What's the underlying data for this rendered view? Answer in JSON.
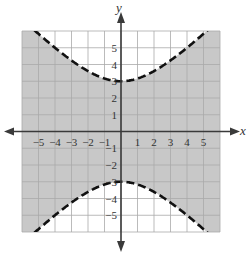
{
  "chart_data": {
    "type": "inequality-graph",
    "title": "",
    "relation": "y^2/9 - x^2/9 < 1",
    "boundary": {
      "curve": "hyperbola",
      "equation": "y^2/9 - x^2/9 = 1",
      "orientation": "vertical",
      "vertices": [
        [
          0,
          3
        ],
        [
          0,
          -3
        ]
      ],
      "style": "dashed"
    },
    "shaded_region": "between branches (contains origin)",
    "xlabel": "x",
    "ylabel": "y",
    "xlim": [
      -6,
      6
    ],
    "ylim": [
      -6,
      6
    ],
    "grid": true,
    "x_ticks": [
      "−5",
      "−4",
      "−3",
      "−2",
      "−1",
      "1",
      "2",
      "3",
      "4",
      "5"
    ],
    "y_ticks": [
      "5",
      "4",
      "3",
      "2",
      "1",
      "−1",
      "−2",
      "−3",
      "−4",
      "−5"
    ],
    "colors": {
      "shade": "#c8c8c8",
      "grid": "#a9a9a9",
      "axis": "#3a3a3a",
      "curve": "#111111"
    }
  }
}
